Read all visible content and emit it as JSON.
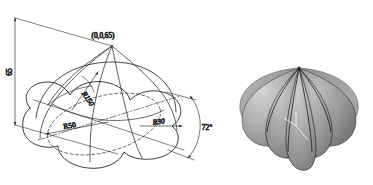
{
  "figure": {
    "background_color": "#ffffff",
    "line_color": "#1a1a1a"
  },
  "drawing": {
    "name": "dimensioned-isometric-view",
    "labels": {
      "apex_coordinate": "(0,0,65)",
      "height": "65",
      "meridian_radius": "R150",
      "outer_radius": "R50",
      "lobe_radius": "R30",
      "lobe_angle": "72°"
    },
    "annotation_list": [
      {
        "id": "apex",
        "text": "(0,0,65)",
        "kind": "coordinate"
      },
      {
        "id": "height",
        "text": "65",
        "kind": "linear-dimension"
      },
      {
        "id": "meridian",
        "text": "R150",
        "kind": "radius-dimension"
      },
      {
        "id": "outer",
        "text": "R50",
        "kind": "radius-dimension"
      },
      {
        "id": "lobe",
        "text": "R30",
        "kind": "radius-dimension"
      },
      {
        "id": "angle",
        "text": "72°",
        "kind": "angular-dimension"
      }
    ]
  },
  "render": {
    "name": "shaded-3d-model",
    "lobe_count": 5,
    "surface_color_light": "#c8c8c8",
    "surface_color_mid": "#9a9a9a",
    "surface_color_dark": "#6e6e6e",
    "crease_color": "#1a1a1a",
    "axis_marker_color": "#f0f0f0"
  }
}
